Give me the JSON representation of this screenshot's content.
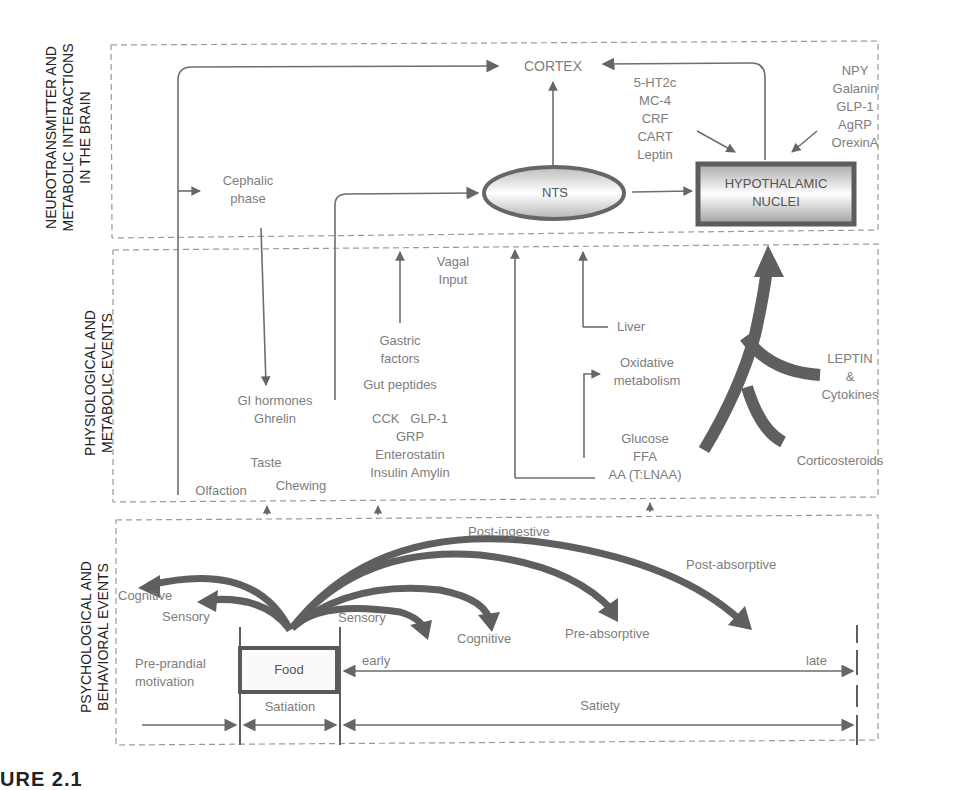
{
  "figure": {
    "caption": "URE 2.1",
    "panels": [
      {
        "id": "brain",
        "label": "NEUROTRANSMITTER AND METABOLIC INTERACTIONS IN THE BRAIN",
        "label_lines": [
          "NEUROTRANSMITTER AND",
          "METABOLIC INTERACTIONS",
          "IN THE BRAIN"
        ]
      },
      {
        "id": "physiological",
        "label": "PHYSIOLOGICAL AND METABOLIC EVENTS",
        "label_lines": [
          "PHYSIOLOGICAL AND",
          "METABOLIC EVENTS"
        ]
      },
      {
        "id": "psychological",
        "label": "PSYCHOLOGICAL AND BEHAVIORAL EVENTS",
        "label_lines": [
          "PSYCHOLOGICAL AND",
          "BEHAVIORAL EVENTS"
        ]
      }
    ]
  },
  "brain": {
    "cortex": "CORTEX",
    "nts": "NTS",
    "hypothalamic_nuclei": [
      "HYPOTHALAMIC",
      "NUCLEI"
    ],
    "cephalic_phase": [
      "Cephalic",
      "phase"
    ],
    "inhibitory_signals": [
      "5-HT2c",
      "MC-4",
      "CRF",
      "CART",
      "Leptin"
    ],
    "orexigenic_signals": [
      "NPY",
      "Galanin",
      "GLP-1",
      "AgRP",
      "OrexinA"
    ]
  },
  "physiological": {
    "vagal_input": [
      "Vagal",
      "Input"
    ],
    "gastric_factors": [
      "Gastric",
      "factors"
    ],
    "gut_peptides": "Gut peptides",
    "peptides_list": [
      "CCK   GLP-1",
      "GRP",
      "Enterostatin",
      "Insulin Amylin"
    ],
    "gi_hormones": [
      "GI hormones",
      "Ghrelin"
    ],
    "taste": "Taste",
    "chewing": "Chewing",
    "olfaction": "Olfaction",
    "liver": "Liver",
    "oxidative_metabolism": [
      "Oxidative",
      "metabolism"
    ],
    "nutrients": [
      "Glucose",
      "FFA",
      "AA (T:LNAA)"
    ],
    "leptin_cytokines": [
      "LEPTIN",
      "&",
      "Cytokines"
    ],
    "corticosteroids": "Corticosteroids"
  },
  "psychological": {
    "cognitive_left": "Cognitive",
    "sensory_left": "Sensory",
    "sensory_right": "Sensory",
    "cognitive_right": "Cognitive",
    "pre_absorptive": "Pre-absorptive",
    "post_ingestive": "Post-ingestive",
    "post_absorptive": "Post-absorptive",
    "pre_prandial": [
      "Pre-prandial",
      "motivation"
    ],
    "food": "Food",
    "early": "early",
    "late": "late",
    "satiation": "Satiation",
    "satiety": "Satiety"
  },
  "colors": {
    "line": "#6e6e6e",
    "thick_arrow": "#5f5f5f",
    "dash": "#9a9a9a",
    "text": "#7d7d7d",
    "side_label": "#222222"
  }
}
